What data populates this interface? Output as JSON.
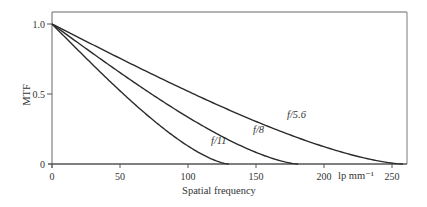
{
  "chart_data": {
    "type": "line",
    "title": "",
    "xlabel": "Spatial frequency",
    "xunit_label": "lp mm⁻¹",
    "ylabel": "MTF",
    "xlim": [
      0,
      262
    ],
    "ylim": [
      0,
      1.08
    ],
    "xticks": [
      0,
      50,
      100,
      150,
      200,
      250
    ],
    "xtick_labels": [
      "0",
      "50",
      "100",
      "150",
      "200",
      "250"
    ],
    "yticks": [
      0,
      0.5,
      1.0
    ],
    "ytick_labels": [
      "0",
      "0.5",
      "1.0"
    ],
    "grid": false,
    "legend": "none (inline curve labels)",
    "series": [
      {
        "name": "f/5.6",
        "label_text": "f/5.6",
        "cutoff": 258,
        "x": [
          0,
          25,
          50,
          75,
          100,
          125,
          150,
          175,
          200,
          225,
          250,
          258
        ],
        "y": [
          1.0,
          0.877,
          0.755,
          0.636,
          0.52,
          0.41,
          0.306,
          0.209,
          0.123,
          0.052,
          0.004,
          0.0
        ]
      },
      {
        "name": "f/8",
        "label_text": "f/8",
        "cutoff": 181,
        "x": [
          0,
          25,
          50,
          75,
          100,
          125,
          150,
          175,
          181
        ],
        "y": [
          1.0,
          0.825,
          0.654,
          0.49,
          0.339,
          0.204,
          0.092,
          0.014,
          0.0
        ]
      },
      {
        "name": "f/11",
        "label_text": "f/11",
        "cutoff": 130,
        "x": [
          0,
          25,
          50,
          75,
          100,
          125,
          130
        ],
        "y": [
          1.0,
          0.756,
          0.523,
          0.313,
          0.139,
          0.017,
          0.0
        ]
      }
    ]
  }
}
